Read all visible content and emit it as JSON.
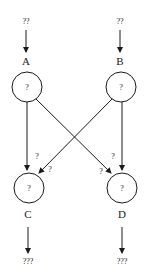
{
  "nodes": {
    "A": {
      "label": "A",
      "value": "?",
      "input": "??"
    },
    "B": {
      "label": "B",
      "value": "?",
      "input": "??"
    },
    "C": {
      "label": "C",
      "value": "?",
      "output": "???"
    },
    "D": {
      "label": "D",
      "value": "?",
      "output": "???"
    }
  },
  "edges": {
    "A_C": {
      "weight": "?"
    },
    "B_C": {
      "weight": "?"
    },
    "A_D": {
      "weight": "?"
    },
    "B_D": {
      "weight": "?"
    }
  },
  "colors": {
    "stroke": "#1a1a1a",
    "background": "#ffffff"
  }
}
